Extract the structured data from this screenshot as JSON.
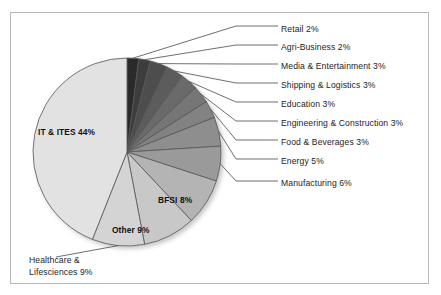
{
  "chart_data": {
    "type": "pie",
    "title": "",
    "subtitle": "",
    "xlabel": "",
    "ylabel": "",
    "legend_position": "none",
    "grid": false,
    "labels_show_percent": true,
    "categories": [
      "Retail",
      "Agri-Business",
      "Media & Entertainment",
      "Shipping & Logistics",
      "Education",
      "Engineering & Construction",
      "Food & Beverages",
      "Energy",
      "Manufacturing",
      "BFSI",
      "Other",
      "Healthcare & Lifesciences",
      "IT & ITES"
    ],
    "values": [
      2,
      2,
      3,
      3,
      3,
      3,
      3,
      5,
      6,
      8,
      9,
      9,
      44
    ],
    "units": "percent",
    "total": 100,
    "slice_colors": [
      "#2b2b2b",
      "#3d3d3d",
      "#4e4e4e",
      "#5c5c5c",
      "#6a6a6a",
      "#767676",
      "#828282",
      "#8e8e8e",
      "#9a9a9a",
      "#b4b4b4",
      "#c8c8c8",
      "#d4d4d4",
      "#e2e2e2"
    ],
    "slice_label_text": [
      "Retail 2%",
      "Agri-Business 2%",
      "Media & Entertainment 3%",
      "Shipping & Logistics 3%",
      "Education 3%",
      "Engineering & Construction 3%",
      "Food & Beverages 3%",
      "Energy 5%",
      "Manufacturing 6%",
      "BFSI 8%",
      "Other 9%",
      "Healthcare & Lifesciences 9%",
      "IT & ITES 44%"
    ],
    "start_angle_deg": 0,
    "direction": "clockwise"
  },
  "labels": {
    "retail": "Retail 2%",
    "agri_business": "Agri-Business 2%",
    "media_entertainment": "Media & Entertainment 3%",
    "shipping_logistics": "Shipping & Logistics 3%",
    "education": "Education 3%",
    "engineering_construction": "Engineering & Construction 3%",
    "food_beverages": "Food & Beverages 3%",
    "energy": "Energy 5%",
    "manufacturing": "Manufacturing 6%",
    "bfsi": "BFSI 8%",
    "other": "Other 9%",
    "healthcare_lifesciences_line1": "Healthcare &",
    "healthcare_lifesciences_line2": "Lifesciences 9%",
    "it_ites": "IT & ITES 44%"
  },
  "colors": {
    "frame_border": "#b9b9b9",
    "slice_outline": "#555555",
    "leader_line": "#4a4a4a",
    "text": "#1d1d1d",
    "background": "#ffffff"
  }
}
